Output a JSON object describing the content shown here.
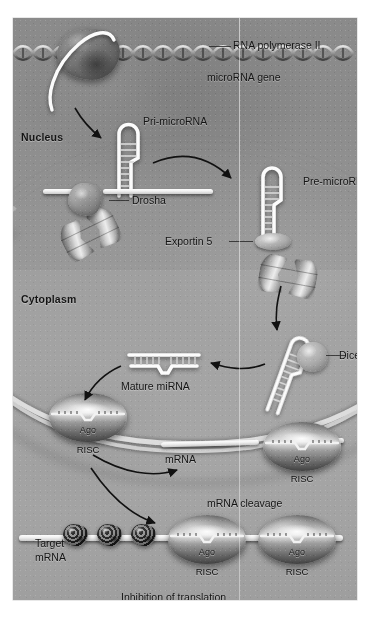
{
  "figure": {
    "compartments": [
      {
        "name": "nucleus",
        "label": "Nucleus"
      },
      {
        "name": "cytoplasm",
        "label": "Cytoplasm"
      }
    ],
    "labels": {
      "rna_polymerase": "RNA polymerase II",
      "microrna_gene": "microRNA gene",
      "pri_microrna": "Pri-microRNA",
      "drosha": "Drosha",
      "pre_microrna": "Pre-microRNA",
      "exportin5": "Exportin 5",
      "dicer": "Dicer",
      "mature_mirna": "Mature miRNA",
      "risc": "RISC",
      "ago": "Ago",
      "mrna": "mRNA",
      "mrna_cleavage": "mRNA cleavage",
      "target_mrna_line1": "Target",
      "target_mrna_line2": "mRNA",
      "inhibition_of_translation": "Inhibition of translation"
    },
    "risc_complexes": [
      {
        "id": "risc-loaded",
        "ago": "Ago",
        "label": "RISC"
      },
      {
        "id": "risc-on-mrna",
        "ago": "Ago",
        "label": "RISC"
      },
      {
        "id": "risc-target-left",
        "ago": "Ago",
        "label": "RISC"
      },
      {
        "id": "risc-target-right",
        "ago": "Ago",
        "label": "RISC"
      }
    ],
    "colors": {
      "plate_background": "#a0a0a0",
      "nucleoplasm": "#8f8f8f",
      "membrane": "#e2e2e2",
      "rna_white": "#ffffff",
      "text": "#141414",
      "arrow": "#111111",
      "ribosome_dark": "#3a3a3a"
    }
  }
}
